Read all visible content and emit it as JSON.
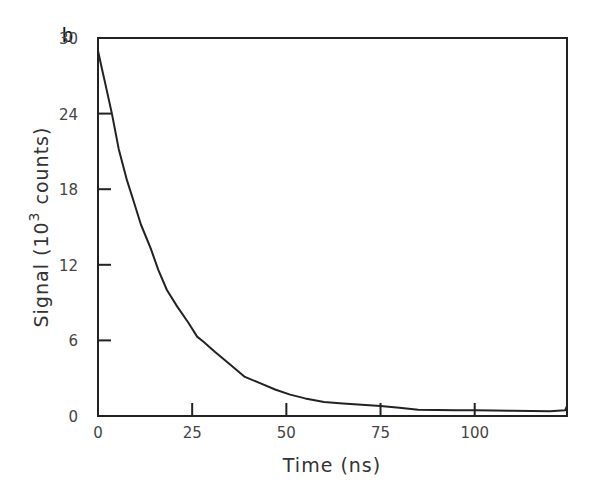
{
  "panel_label": "b",
  "chart_data": {
    "type": "line",
    "title": "",
    "panel": "b",
    "xlabel": "Time (ns)",
    "ylabel": "Signal (10^3 counts)",
    "ylabel_parts": {
      "prefix": "Signal (10",
      "superscript": "3",
      "suffix": " counts)"
    },
    "xlim": [
      0,
      124.5
    ],
    "ylim": [
      0,
      30
    ],
    "xticks": [
      0,
      25,
      50,
      75,
      100
    ],
    "xtick_labels": [
      "0",
      "25",
      "50",
      "75",
      "100"
    ],
    "yticks": [
      0,
      6,
      12,
      18,
      24,
      30
    ],
    "ytick_labels": [
      "0",
      "6",
      "12",
      "18",
      "24",
      "30"
    ],
    "grid": false,
    "legend": null,
    "series": [
      {
        "name": "Signal decay",
        "color": "#222222",
        "x": [
          0,
          1,
          2,
          3.7,
          5.5,
          7.7,
          9.5,
          11.4,
          14,
          16,
          18.3,
          21,
          24,
          26.3,
          28,
          31,
          35,
          39,
          43,
          47,
          51,
          55,
          60,
          65,
          70,
          75,
          80,
          85,
          90,
          95,
          100,
          105,
          110,
          115,
          120,
          124,
          124.5
        ],
        "y": [
          29.0,
          27.6,
          26.3,
          24.0,
          21.2,
          18.7,
          17.0,
          15.2,
          13.3,
          11.6,
          10.0,
          8.7,
          7.4,
          6.3,
          5.9,
          5.1,
          4.1,
          3.1,
          2.6,
          2.1,
          1.7,
          1.4,
          1.1,
          1.0,
          0.9,
          0.8,
          0.65,
          0.5,
          0.48,
          0.46,
          0.45,
          0.43,
          0.42,
          0.4,
          0.38,
          0.45,
          0.8
        ]
      }
    ]
  }
}
